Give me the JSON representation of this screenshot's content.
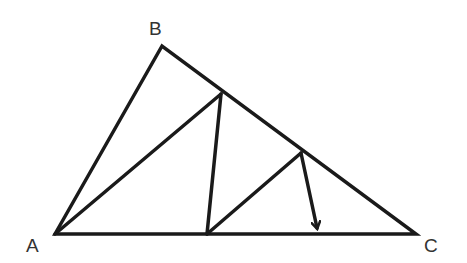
{
  "diagram": {
    "type": "geometry-triangle",
    "stroke_color": "#1a1a1a",
    "label_color": "#333333",
    "points": {
      "A": {
        "label": "A",
        "x": 55,
        "y": 234
      },
      "B": {
        "label": "B",
        "x": 162,
        "y": 46
      },
      "C": {
        "label": "C",
        "x": 416,
        "y": 234
      },
      "D": {
        "x": 221,
        "y": 94
      },
      "E": {
        "x": 207,
        "y": 234
      },
      "F": {
        "x": 301,
        "y": 153
      },
      "G": {
        "x": 318,
        "y": 232
      }
    },
    "segments": [
      "AB",
      "BC",
      "CA",
      "AD",
      "DE",
      "EF"
    ],
    "arrow": {
      "from": "F",
      "to": "G"
    },
    "labels": {
      "A": "A",
      "B": "B",
      "C": "C"
    }
  }
}
